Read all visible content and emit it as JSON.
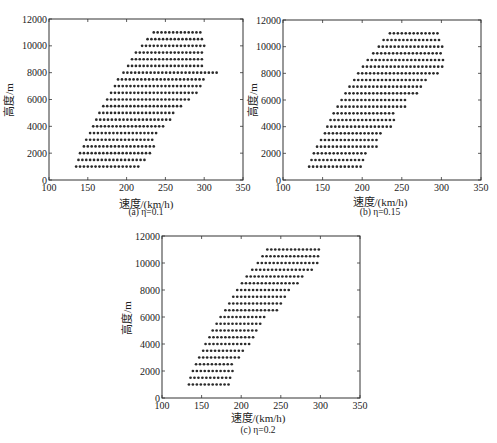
{
  "chart_data": [
    {
      "type": "scatter",
      "panel": "a",
      "caption": "(a) η=0.1",
      "title": "",
      "xlabel": "速度/(km/h)",
      "ylabel": "高度/m",
      "xlim": [
        100,
        350
      ],
      "ylim": [
        0,
        12000
      ],
      "xticks": [
        100,
        150,
        200,
        250,
        300,
        350
      ],
      "yticks": [
        0,
        2000,
        4000,
        6000,
        8000,
        10000,
        12000
      ],
      "grid": false,
      "legend": null,
      "marker": "dot",
      "speed_step": 5,
      "rows": [
        {
          "altitude": 1000,
          "speed_min": 135,
          "speed_max": 215
        },
        {
          "altitude": 1500,
          "speed_min": 138,
          "speed_max": 223
        },
        {
          "altitude": 2000,
          "speed_min": 140,
          "speed_max": 230
        },
        {
          "altitude": 2500,
          "speed_min": 145,
          "speed_max": 237
        },
        {
          "altitude": 3000,
          "speed_min": 148,
          "speed_max": 236
        },
        {
          "altitude": 3500,
          "speed_min": 153,
          "speed_max": 241
        },
        {
          "altitude": 4000,
          "speed_min": 157,
          "speed_max": 251
        },
        {
          "altitude": 4500,
          "speed_min": 161,
          "speed_max": 260
        },
        {
          "altitude": 5000,
          "speed_min": 165,
          "speed_max": 263
        },
        {
          "altitude": 5500,
          "speed_min": 170,
          "speed_max": 271
        },
        {
          "altitude": 6000,
          "speed_min": 175,
          "speed_max": 281
        },
        {
          "altitude": 6500,
          "speed_min": 180,
          "speed_max": 292
        },
        {
          "altitude": 7000,
          "speed_min": 185,
          "speed_max": 298
        },
        {
          "altitude": 7500,
          "speed_min": 189,
          "speed_max": 303
        },
        {
          "altitude": 8000,
          "speed_min": 196,
          "speed_max": 316
        },
        {
          "altitude": 8500,
          "speed_min": 202,
          "speed_max": 300
        },
        {
          "altitude": 9000,
          "speed_min": 207,
          "speed_max": 300
        },
        {
          "altitude": 9500,
          "speed_min": 212,
          "speed_max": 300
        },
        {
          "altitude": 10000,
          "speed_min": 220,
          "speed_max": 300
        },
        {
          "altitude": 10500,
          "speed_min": 227,
          "speed_max": 300
        },
        {
          "altitude": 11000,
          "speed_min": 235,
          "speed_max": 297
        }
      ]
    },
    {
      "type": "scatter",
      "panel": "b",
      "caption": "(b) η=0.15",
      "title": "",
      "xlabel": "速度/(km/h)",
      "ylabel": "高度/m",
      "xlim": [
        100,
        350
      ],
      "ylim": [
        0,
        12000
      ],
      "xticks": [
        100,
        150,
        200,
        250,
        300,
        350
      ],
      "yticks": [
        0,
        2000,
        4000,
        6000,
        8000,
        10000,
        12000
      ],
      "grid": false,
      "legend": null,
      "marker": "dot",
      "speed_step": 5,
      "rows": [
        {
          "altitude": 1000,
          "speed_min": 133,
          "speed_max": 202
        },
        {
          "altitude": 1500,
          "speed_min": 136,
          "speed_max": 204
        },
        {
          "altitude": 2000,
          "speed_min": 139,
          "speed_max": 208
        },
        {
          "altitude": 2500,
          "speed_min": 143,
          "speed_max": 219
        },
        {
          "altitude": 3000,
          "speed_min": 148,
          "speed_max": 220
        },
        {
          "altitude": 3500,
          "speed_min": 153,
          "speed_max": 225
        },
        {
          "altitude": 4000,
          "speed_min": 156,
          "speed_max": 236
        },
        {
          "altitude": 4500,
          "speed_min": 160,
          "speed_max": 240
        },
        {
          "altitude": 5000,
          "speed_min": 164,
          "speed_max": 240
        },
        {
          "altitude": 5500,
          "speed_min": 169,
          "speed_max": 257
        },
        {
          "altitude": 6000,
          "speed_min": 174,
          "speed_max": 257
        },
        {
          "altitude": 6500,
          "speed_min": 179,
          "speed_max": 270
        },
        {
          "altitude": 7000,
          "speed_min": 184,
          "speed_max": 275
        },
        {
          "altitude": 7500,
          "speed_min": 190,
          "speed_max": 281
        },
        {
          "altitude": 8000,
          "speed_min": 195,
          "speed_max": 295
        },
        {
          "altitude": 8500,
          "speed_min": 201,
          "speed_max": 302
        },
        {
          "altitude": 9000,
          "speed_min": 207,
          "speed_max": 302
        },
        {
          "altitude": 9500,
          "speed_min": 214,
          "speed_max": 302
        },
        {
          "altitude": 10000,
          "speed_min": 221,
          "speed_max": 302
        },
        {
          "altitude": 10500,
          "speed_min": 227,
          "speed_max": 300
        },
        {
          "altitude": 11000,
          "speed_min": 235,
          "speed_max": 299
        }
      ]
    },
    {
      "type": "scatter",
      "panel": "c",
      "caption": "(c) η=0.2",
      "title": "",
      "xlabel": "速度/(km/h)",
      "ylabel": "高度/m",
      "xlim": [
        100,
        350
      ],
      "ylim": [
        0,
        12000
      ],
      "xticks": [
        100,
        150,
        200,
        250,
        300,
        350
      ],
      "yticks": [
        0,
        2000,
        4000,
        6000,
        8000,
        10000,
        12000
      ],
      "grid": false,
      "legend": null,
      "marker": "dot",
      "speed_step": 5,
      "rows": [
        {
          "altitude": 1000,
          "speed_min": 134,
          "speed_max": 184
        },
        {
          "altitude": 1500,
          "speed_min": 136,
          "speed_max": 187
        },
        {
          "altitude": 2000,
          "speed_min": 139,
          "speed_max": 190
        },
        {
          "altitude": 2500,
          "speed_min": 143,
          "speed_max": 192
        },
        {
          "altitude": 3000,
          "speed_min": 147,
          "speed_max": 198
        },
        {
          "altitude": 3500,
          "speed_min": 152,
          "speed_max": 202
        },
        {
          "altitude": 4000,
          "speed_min": 155,
          "speed_max": 212
        },
        {
          "altitude": 4500,
          "speed_min": 160,
          "speed_max": 218
        },
        {
          "altitude": 5000,
          "speed_min": 164,
          "speed_max": 223
        },
        {
          "altitude": 5500,
          "speed_min": 169,
          "speed_max": 227
        },
        {
          "altitude": 6000,
          "speed_min": 174,
          "speed_max": 232
        },
        {
          "altitude": 6500,
          "speed_min": 180,
          "speed_max": 245
        },
        {
          "altitude": 7000,
          "speed_min": 185,
          "speed_max": 250
        },
        {
          "altitude": 7500,
          "speed_min": 190,
          "speed_max": 255
        },
        {
          "altitude": 8000,
          "speed_min": 195,
          "speed_max": 261
        },
        {
          "altitude": 8500,
          "speed_min": 201,
          "speed_max": 274
        },
        {
          "altitude": 9000,
          "speed_min": 207,
          "speed_max": 279
        },
        {
          "altitude": 9500,
          "speed_min": 214,
          "speed_max": 293
        },
        {
          "altitude": 10000,
          "speed_min": 221,
          "speed_max": 300
        },
        {
          "altitude": 10500,
          "speed_min": 227,
          "speed_max": 300
        },
        {
          "altitude": 11000,
          "speed_min": 233,
          "speed_max": 298
        }
      ]
    }
  ],
  "style": {
    "marker_color": "#2a2a2a",
    "axis_color": "#333333",
    "background": "#ffffff"
  }
}
